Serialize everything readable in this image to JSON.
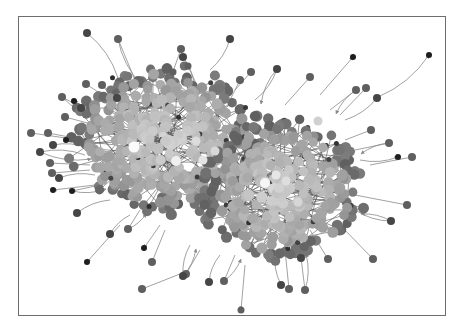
{
  "figure": {
    "type": "network-graph",
    "width": 462,
    "height": 330,
    "background": "#ffffff",
    "frame": {
      "x": 18,
      "y": 16,
      "width": 427,
      "height": 299,
      "stroke": "#6e6e6e"
    },
    "edge_color": "#8a8a8a",
    "palette": {
      "dark": "#2e2e2e",
      "mid": "#707070",
      "light": "#a8a8a8",
      "lighter": "#c4c4c4",
      "white": "#f4f4f4"
    },
    "clusters": [
      {
        "name": "left-cluster",
        "cx": 165,
        "cy": 140,
        "rx": 92,
        "ry": 72,
        "count": 420,
        "seed": 7
      },
      {
        "name": "right-cluster",
        "cx": 282,
        "cy": 190,
        "rx": 80,
        "ry": 70,
        "count": 360,
        "seed": 13
      }
    ],
    "highlight_nodes": [
      {
        "x": 134,
        "y": 147,
        "r": 5.5,
        "shade": "#fbfbfb"
      },
      {
        "x": 176,
        "y": 161,
        "r": 5,
        "shade": "#f0f0f0"
      },
      {
        "x": 203,
        "y": 160,
        "r": 4.5,
        "shade": "#e4e4e4"
      },
      {
        "x": 196,
        "y": 141,
        "r": 4.5,
        "shade": "#dcdcdc"
      },
      {
        "x": 215,
        "y": 151,
        "r": 4.5,
        "shade": "#d8d8d8"
      },
      {
        "x": 265,
        "y": 183,
        "r": 5,
        "shade": "#f6f6f6"
      },
      {
        "x": 276,
        "y": 175,
        "r": 4.5,
        "shade": "#e6e6e6"
      },
      {
        "x": 286,
        "y": 181,
        "r": 4.5,
        "shade": "#dedede"
      },
      {
        "x": 298,
        "y": 202,
        "r": 4.5,
        "shade": "#d6d6d6"
      },
      {
        "x": 318,
        "y": 121,
        "r": 4.5,
        "shade": "#d0d0d0"
      }
    ],
    "outer_nodes": [
      {
        "x": 87,
        "y": 33,
        "r": 4,
        "target": [
          118,
          78
        ]
      },
      {
        "x": 118,
        "y": 39,
        "r": 4,
        "target": [
          135,
          80
        ]
      },
      {
        "x": 181,
        "y": 49,
        "r": 4,
        "target": [
          170,
          80
        ]
      },
      {
        "x": 183,
        "y": 57,
        "r": 4,
        "target": [
          195,
          90
        ]
      },
      {
        "x": 188,
        "y": 66,
        "r": 3.5,
        "target": [
          200,
          92
        ]
      },
      {
        "x": 173,
        "y": 72,
        "r": 3.5,
        "target": [
          175,
          95
        ]
      },
      {
        "x": 230,
        "y": 39,
        "r": 4,
        "target": [
          210,
          70
        ]
      },
      {
        "x": 251,
        "y": 72,
        "r": 4,
        "target": [
          235,
          90
        ]
      },
      {
        "x": 240,
        "y": 80,
        "r": 4,
        "target": [
          230,
          100
        ]
      },
      {
        "x": 277,
        "y": 69,
        "r": 4,
        "target": [
          255,
          100
        ]
      },
      {
        "x": 310,
        "y": 77,
        "r": 4,
        "target": [
          285,
          105
        ]
      },
      {
        "x": 353,
        "y": 57,
        "r": 3,
        "target": [
          320,
          95
        ]
      },
      {
        "x": 429,
        "y": 55,
        "r": 3,
        "target": [
          378,
          97
        ]
      },
      {
        "x": 356,
        "y": 90,
        "r": 4,
        "target": [
          330,
          110
        ]
      },
      {
        "x": 366,
        "y": 88,
        "r": 4,
        "target": [
          340,
          115
        ]
      },
      {
        "x": 377,
        "y": 98,
        "r": 4,
        "target": [
          345,
          120
        ]
      },
      {
        "x": 371,
        "y": 130,
        "r": 4,
        "target": [
          345,
          140
        ]
      },
      {
        "x": 389,
        "y": 143,
        "r": 4,
        "target": [
          355,
          150
        ]
      },
      {
        "x": 398,
        "y": 157,
        "r": 3,
        "target": [
          360,
          160
        ]
      },
      {
        "x": 412,
        "y": 157,
        "r": 4,
        "target": [
          370,
          165
        ]
      },
      {
        "x": 407,
        "y": 205,
        "r": 4,
        "target": [
          355,
          195
        ]
      },
      {
        "x": 391,
        "y": 221,
        "r": 4,
        "target": [
          355,
          210
        ]
      },
      {
        "x": 373,
        "y": 259,
        "r": 4,
        "target": [
          340,
          225
        ]
      },
      {
        "x": 328,
        "y": 259,
        "r": 4,
        "target": [
          310,
          230
        ]
      },
      {
        "x": 301,
        "y": 258,
        "r": 4,
        "target": [
          295,
          235
        ]
      },
      {
        "x": 305,
        "y": 290,
        "r": 4,
        "target": [
          300,
          250
        ]
      },
      {
        "x": 289,
        "y": 289,
        "r": 4,
        "target": [
          285,
          250
        ]
      },
      {
        "x": 281,
        "y": 285,
        "r": 4,
        "target": [
          275,
          250
        ]
      },
      {
        "x": 241,
        "y": 310,
        "r": 3.5,
        "target": [
          245,
          265
        ]
      },
      {
        "x": 224,
        "y": 281,
        "r": 4,
        "target": [
          235,
          255
        ]
      },
      {
        "x": 209,
        "y": 282,
        "r": 4,
        "target": [
          220,
          255
        ]
      },
      {
        "x": 186,
        "y": 274,
        "r": 4,
        "target": [
          200,
          250
        ]
      },
      {
        "x": 142,
        "y": 289,
        "r": 4,
        "target": [
          185,
          272
        ]
      },
      {
        "x": 183,
        "y": 276,
        "r": 4,
        "target": [
          190,
          245
        ]
      },
      {
        "x": 152,
        "y": 262,
        "r": 4,
        "target": [
          165,
          230
        ]
      },
      {
        "x": 144,
        "y": 248,
        "r": 3,
        "target": [
          160,
          225
        ]
      },
      {
        "x": 110,
        "y": 234,
        "r": 4,
        "target": [
          130,
          215
        ]
      },
      {
        "x": 128,
        "y": 229,
        "r": 4,
        "target": [
          140,
          210
        ]
      },
      {
        "x": 87,
        "y": 262,
        "r": 3,
        "target": [
          120,
          225
        ]
      },
      {
        "x": 77,
        "y": 213,
        "r": 4,
        "target": [
          110,
          200
        ]
      },
      {
        "x": 53,
        "y": 190,
        "r": 3,
        "target": [
          95,
          185
        ]
      },
      {
        "x": 72,
        "y": 191,
        "r": 3,
        "target": [
          100,
          185
        ]
      },
      {
        "x": 59,
        "y": 178,
        "r": 4,
        "target": [
          95,
          175
        ]
      },
      {
        "x": 52,
        "y": 173,
        "r": 4,
        "target": [
          90,
          170
        ]
      },
      {
        "x": 50,
        "y": 163,
        "r": 4,
        "target": [
          90,
          165
        ]
      },
      {
        "x": 40,
        "y": 152,
        "r": 4,
        "target": [
          85,
          155
        ]
      },
      {
        "x": 31,
        "y": 133,
        "r": 4,
        "target": [
          80,
          140
        ]
      },
      {
        "x": 48,
        "y": 133,
        "r": 4,
        "target": [
          85,
          140
        ]
      },
      {
        "x": 53,
        "y": 145,
        "r": 4,
        "target": [
          88,
          148
        ]
      },
      {
        "x": 62,
        "y": 97,
        "r": 4,
        "target": [
          95,
          115
        ]
      },
      {
        "x": 65,
        "y": 117,
        "r": 4,
        "target": [
          95,
          125
        ]
      },
      {
        "x": 81,
        "y": 108,
        "r": 4,
        "target": [
          100,
          120
        ]
      },
      {
        "x": 86,
        "y": 84,
        "r": 4,
        "target": [
          110,
          100
        ]
      },
      {
        "x": 102,
        "y": 85,
        "r": 4,
        "target": [
          120,
          100
        ]
      },
      {
        "x": 117,
        "y": 98,
        "r": 4,
        "target": [
          130,
          110
        ]
      },
      {
        "x": 74,
        "y": 101,
        "r": 3,
        "target": [
          100,
          115
        ]
      },
      {
        "x": 66,
        "y": 140,
        "r": 3,
        "target": [
          95,
          145
        ]
      }
    ]
  }
}
